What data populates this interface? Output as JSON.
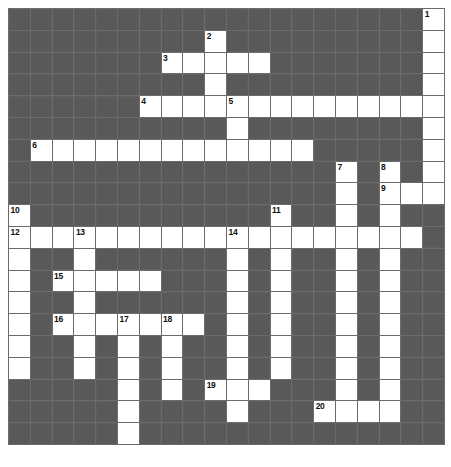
{
  "puzzle": {
    "title": "Crossword Puzzle Grid",
    "columns": 20,
    "rows": 20,
    "cell_size_px": 20.8,
    "colors": {
      "block": "#575757",
      "open": "#ffffff",
      "gridline": "#6b6b6b",
      "number": "#111111",
      "page_background": "#ffffff"
    },
    "open_cells": [
      [
        0,
        19
      ],
      [
        1,
        9
      ],
      [
        1,
        19
      ],
      [
        2,
        7
      ],
      [
        2,
        8
      ],
      [
        2,
        9
      ],
      [
        2,
        10
      ],
      [
        2,
        11
      ],
      [
        2,
        19
      ],
      [
        3,
        9
      ],
      [
        3,
        19
      ],
      [
        4,
        6
      ],
      [
        4,
        7
      ],
      [
        4,
        8
      ],
      [
        4,
        9
      ],
      [
        4,
        10
      ],
      [
        4,
        11
      ],
      [
        4,
        12
      ],
      [
        4,
        13
      ],
      [
        4,
        14
      ],
      [
        4,
        15
      ],
      [
        4,
        16
      ],
      [
        4,
        17
      ],
      [
        4,
        18
      ],
      [
        4,
        19
      ],
      [
        5,
        10
      ],
      [
        5,
        19
      ],
      [
        6,
        1
      ],
      [
        6,
        2
      ],
      [
        6,
        3
      ],
      [
        6,
        4
      ],
      [
        6,
        5
      ],
      [
        6,
        6
      ],
      [
        6,
        7
      ],
      [
        6,
        8
      ],
      [
        6,
        9
      ],
      [
        6,
        10
      ],
      [
        6,
        11
      ],
      [
        6,
        12
      ],
      [
        6,
        13
      ],
      [
        6,
        19
      ],
      [
        7,
        15
      ],
      [
        7,
        17
      ],
      [
        7,
        19
      ],
      [
        8,
        15
      ],
      [
        8,
        17
      ],
      [
        8,
        18
      ],
      [
        8,
        19
      ],
      [
        9,
        0
      ],
      [
        9,
        12
      ],
      [
        9,
        15
      ],
      [
        9,
        17
      ],
      [
        10,
        0
      ],
      [
        10,
        1
      ],
      [
        10,
        2
      ],
      [
        10,
        3
      ],
      [
        10,
        4
      ],
      [
        10,
        5
      ],
      [
        10,
        6
      ],
      [
        10,
        7
      ],
      [
        10,
        8
      ],
      [
        10,
        9
      ],
      [
        10,
        10
      ],
      [
        10,
        11
      ],
      [
        10,
        12
      ],
      [
        10,
        13
      ],
      [
        10,
        14
      ],
      [
        10,
        15
      ],
      [
        10,
        16
      ],
      [
        10,
        17
      ],
      [
        10,
        18
      ],
      [
        11,
        0
      ],
      [
        11,
        3
      ],
      [
        11,
        10
      ],
      [
        11,
        12
      ],
      [
        11,
        15
      ],
      [
        11,
        17
      ],
      [
        12,
        0
      ],
      [
        12,
        2
      ],
      [
        12,
        3
      ],
      [
        12,
        4
      ],
      [
        12,
        5
      ],
      [
        12,
        6
      ],
      [
        12,
        10
      ],
      [
        12,
        12
      ],
      [
        12,
        15
      ],
      [
        12,
        17
      ],
      [
        13,
        0
      ],
      [
        13,
        3
      ],
      [
        13,
        10
      ],
      [
        13,
        12
      ],
      [
        13,
        15
      ],
      [
        13,
        17
      ],
      [
        14,
        0
      ],
      [
        14,
        2
      ],
      [
        14,
        3
      ],
      [
        14,
        4
      ],
      [
        14,
        5
      ],
      [
        14,
        6
      ],
      [
        14,
        7
      ],
      [
        14,
        8
      ],
      [
        14,
        10
      ],
      [
        14,
        12
      ],
      [
        14,
        15
      ],
      [
        14,
        17
      ],
      [
        15,
        0
      ],
      [
        15,
        3
      ],
      [
        15,
        5
      ],
      [
        15,
        7
      ],
      [
        15,
        10
      ],
      [
        15,
        12
      ],
      [
        15,
        15
      ],
      [
        15,
        17
      ],
      [
        16,
        0
      ],
      [
        16,
        3
      ],
      [
        16,
        5
      ],
      [
        16,
        7
      ],
      [
        16,
        10
      ],
      [
        16,
        12
      ],
      [
        16,
        15
      ],
      [
        16,
        17
      ],
      [
        17,
        5
      ],
      [
        17,
        7
      ],
      [
        17,
        9
      ],
      [
        17,
        10
      ],
      [
        17,
        11
      ],
      [
        17,
        15
      ],
      [
        17,
        17
      ],
      [
        18,
        5
      ],
      [
        18,
        10
      ],
      [
        18,
        14
      ],
      [
        18,
        15
      ],
      [
        18,
        16
      ],
      [
        18,
        17
      ],
      [
        19,
        5
      ]
    ],
    "clue_numbers": [
      {
        "n": "1",
        "row": 0,
        "col": 19
      },
      {
        "n": "2",
        "row": 1,
        "col": 9
      },
      {
        "n": "3",
        "row": 2,
        "col": 7
      },
      {
        "n": "4",
        "row": 4,
        "col": 6
      },
      {
        "n": "5",
        "row": 4,
        "col": 10
      },
      {
        "n": "6",
        "row": 6,
        "col": 1
      },
      {
        "n": "7",
        "row": 7,
        "col": 15
      },
      {
        "n": "8",
        "row": 7,
        "col": 17
      },
      {
        "n": "9",
        "row": 8,
        "col": 17
      },
      {
        "n": "10",
        "row": 9,
        "col": 0
      },
      {
        "n": "11",
        "row": 9,
        "col": 12
      },
      {
        "n": "12",
        "row": 10,
        "col": 0
      },
      {
        "n": "13",
        "row": 10,
        "col": 3
      },
      {
        "n": "14",
        "row": 10,
        "col": 10
      },
      {
        "n": "15",
        "row": 12,
        "col": 2
      },
      {
        "n": "16",
        "row": 14,
        "col": 2
      },
      {
        "n": "17",
        "row": 14,
        "col": 5
      },
      {
        "n": "18",
        "row": 14,
        "col": 7
      },
      {
        "n": "19",
        "row": 17,
        "col": 9
      },
      {
        "n": "20",
        "row": 18,
        "col": 14
      }
    ]
  }
}
